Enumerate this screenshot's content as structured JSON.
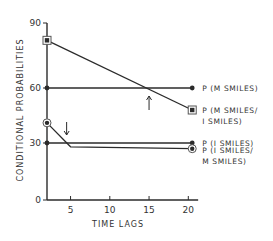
{
  "chart_data": {
    "type": "line",
    "title": "",
    "xlabel": "TIME LAGS",
    "ylabel": "CONDITIONAL PROBABILITIES",
    "x_ticks": [
      5,
      10,
      15,
      20
    ],
    "y_ticks": [
      0,
      30,
      60,
      90
    ],
    "xlim": [
      2,
      21
    ],
    "ylim": [
      0,
      90
    ],
    "grid": false,
    "legend_position": "inline-right",
    "series": [
      {
        "name": "P (M SMILES)",
        "label_lines": [
          "P (M SMILES)"
        ],
        "marker": "dot",
        "x": [
          2,
          20.5
        ],
        "values": [
          60,
          60
        ]
      },
      {
        "name": "P (M SMILES/ I SMILES)",
        "label_lines": [
          "P (M SMILES/",
          "I SMILES)"
        ],
        "marker": "square",
        "x": [
          2,
          20.5
        ],
        "values": [
          82,
          48
        ]
      },
      {
        "name": "P (I SMILES)",
        "label_lines": [
          "P (I SMILES)"
        ],
        "marker": "dot",
        "x": [
          2,
          20.5
        ],
        "values": [
          30,
          30
        ]
      },
      {
        "name": "P (I SMILES/ M SMILES)",
        "label_lines": [
          "P (I SMILES/",
          "M SMILES)"
        ],
        "marker": "circle",
        "x": [
          2,
          5,
          20.5
        ],
        "values": [
          41,
          28,
          27
        ]
      }
    ],
    "annotations": [
      {
        "type": "arrow-up",
        "x": 15,
        "note": "crossing of P(M SMILES/I SMILES) with P(M SMILES)"
      },
      {
        "type": "arrow-down",
        "x": 4.5,
        "note": "crossing of P(I SMILES/M SMILES) with P(I SMILES)"
      }
    ]
  }
}
